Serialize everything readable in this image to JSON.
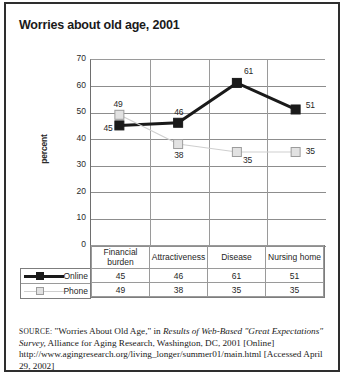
{
  "figure": {
    "title": "Worries about old age, 2001",
    "source_prefix": "SOURCE:",
    "source_part1": " \"Worries About Old Age,\" in ",
    "source_italic1": "Results of Web-Based \"Great Expectations\" Survey,",
    "source_part2": " Alliance for Aging Research, Washington, DC, 2001 [Online] http://www.agingresearch.org/living_longer/summer01/main.html [Accessed April 29, 2002]"
  },
  "chart_data": {
    "type": "line",
    "title": "Worries about old age, 2001",
    "xlabel": "",
    "ylabel": "percent",
    "ylim": [
      0,
      70
    ],
    "yticks": [
      70,
      60,
      50,
      40,
      30,
      20,
      10,
      0
    ],
    "grid": true,
    "legend_position": "bottom-left",
    "categories": [
      "Financial burden",
      "Attractiveness",
      "Disease",
      "Nursing home"
    ],
    "series": [
      {
        "name": "Online",
        "values": [
          45,
          46,
          61,
          51
        ],
        "color": "#1a1a1a",
        "marker": "filled-square"
      },
      {
        "name": "Phone",
        "values": [
          49,
          38,
          35,
          35
        ],
        "color": "#cfcfcf",
        "marker": "open-square"
      }
    ]
  },
  "table": {
    "headers": [
      "Financial burden",
      "Attractiveness",
      "Disease",
      "Nursing home"
    ],
    "rows": [
      {
        "label": "Online",
        "values": [
          "45",
          "46",
          "61",
          "51"
        ]
      },
      {
        "label": "Phone",
        "values": [
          "49",
          "38",
          "35",
          "35"
        ]
      }
    ]
  }
}
